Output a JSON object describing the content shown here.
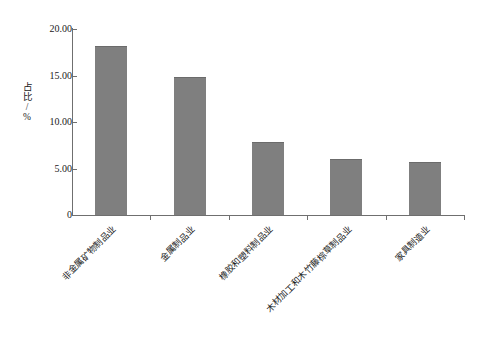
{
  "chart_data": {
    "type": "bar",
    "title": "",
    "subtitle": "",
    "xlabel": "",
    "ylabel": "占比/%",
    "ylim": [
      0,
      20
    ],
    "ytick_labels": [
      "20.00",
      "15.00",
      "10.00",
      "5.00",
      "0"
    ],
    "ytick_values": [
      20,
      15,
      10,
      5,
      0
    ],
    "grid": false,
    "legend": null,
    "bar_color": "#7f7f7f",
    "axis_color": "#6f6f6f",
    "categories": [
      "非金属矿物制品业",
      "金属制品业",
      "橡胶和塑料制品业",
      "木材加工和木竹藤棕草制品业",
      "家具制造业"
    ],
    "values": [
      18.2,
      14.8,
      7.9,
      6.0,
      5.7
    ],
    "label_rotation": -45
  }
}
